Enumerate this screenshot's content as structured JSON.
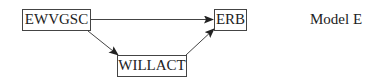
{
  "diagram": {
    "title": "Model E",
    "nodes": [
      {
        "id": "EWVGSC",
        "label": "EWVGSC"
      },
      {
        "id": "ERB",
        "label": "ERB"
      },
      {
        "id": "WILLACT",
        "label": "WILLACT"
      }
    ],
    "edges": [
      {
        "from": "EWVGSC",
        "to": "ERB"
      },
      {
        "from": "EWVGSC",
        "to": "WILLACT"
      },
      {
        "from": "WILLACT",
        "to": "ERB"
      }
    ],
    "colors": {
      "stroke": "#444444",
      "text": "#222222"
    }
  }
}
